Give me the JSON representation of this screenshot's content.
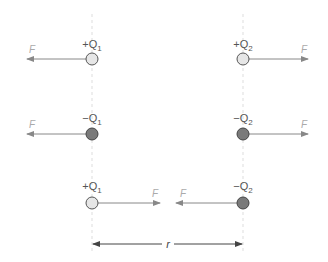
{
  "diagram": {
    "colors": {
      "positive_fill": "#e6e6e6",
      "negative_fill": "#7a7a7a",
      "charge_stroke": "#555555",
      "force_arrow": "#888888",
      "force_label": "#aaaaaa",
      "guide_line": "#dddddd",
      "distance_arrow": "#444444"
    },
    "guides": {
      "left_x": 92,
      "right_x": 243
    },
    "rows": [
      {
        "y": 59,
        "left_charge": {
          "sign": "+",
          "name": "Q",
          "sub": "1",
          "type": "positive"
        },
        "right_charge": {
          "sign": "+",
          "name": "Q",
          "sub": "2",
          "type": "positive"
        },
        "left_force": {
          "label": "F",
          "direction": "left"
        },
        "right_force": {
          "label": "F",
          "direction": "right"
        },
        "interaction": "repulsion"
      },
      {
        "y": 134,
        "left_charge": {
          "sign": "−",
          "name": "Q",
          "sub": "1",
          "type": "negative"
        },
        "right_charge": {
          "sign": "−",
          "name": "Q",
          "sub": "2",
          "type": "negative"
        },
        "left_force": {
          "label": "F",
          "direction": "left"
        },
        "right_force": {
          "label": "F",
          "direction": "right"
        },
        "interaction": "repulsion"
      },
      {
        "y": 203,
        "left_charge": {
          "sign": "+",
          "name": "Q",
          "sub": "1",
          "type": "positive"
        },
        "right_charge": {
          "sign": "−",
          "name": "Q",
          "sub": "2",
          "type": "negative"
        },
        "left_force": {
          "label": "F",
          "direction": "right"
        },
        "right_force": {
          "label": "F",
          "direction": "left"
        },
        "interaction": "attraction"
      }
    ],
    "distance": {
      "label": "r"
    }
  }
}
